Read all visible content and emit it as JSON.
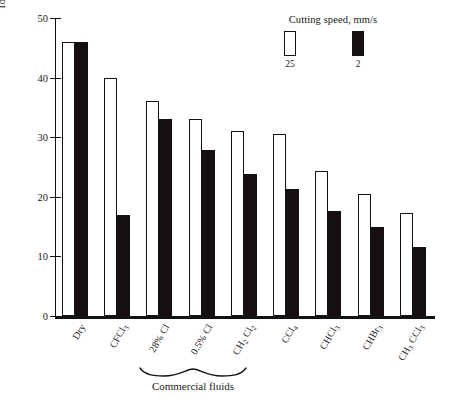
{
  "chart_data": {
    "type": "bar",
    "title": "",
    "xlabel": "",
    "ylabel": "Tool-chip friction angle β, deg",
    "ylim": [
      0,
      50
    ],
    "yticks": [
      0,
      10,
      20,
      30,
      40,
      50
    ],
    "grid": false,
    "legend": {
      "title": "Cutting speed, mm/s",
      "position": "top-right",
      "entries": [
        {
          "label": "25",
          "style": "open",
          "color": "#ffffff"
        },
        {
          "label": "2",
          "style": "filled",
          "color": "#150f10"
        }
      ]
    },
    "categories": [
      "Dry",
      "CFCl3",
      "28% Cl",
      "0.5% Cl",
      "CH2 Cl2",
      "CCl4",
      "CHCl3",
      "CHBr3",
      "CH3 CCl3"
    ],
    "series": [
      {
        "name": "25",
        "values": [
          46.0,
          40.0,
          36.0,
          33.0,
          31.0,
          30.5,
          24.3,
          20.5,
          17.3
        ]
      },
      {
        "name": "2",
        "values": [
          46.0,
          17.0,
          33.0,
          27.8,
          23.8,
          21.3,
          17.6,
          15.0,
          11.5
        ]
      }
    ],
    "annotations": [
      {
        "text": "Commercial fluids",
        "kind": "brace-label",
        "covers": [
          "28% Cl",
          "0.5% Cl"
        ]
      }
    ]
  },
  "axis": {
    "y_title": "Tool-chip friction angle β, deg",
    "y_tick_labels": [
      "50",
      "40",
      "30",
      "20",
      "10",
      "0"
    ]
  },
  "x_labels": [
    {
      "html": "Dry"
    },
    {
      "html": "CFCl<sub>3</sub>"
    },
    {
      "html": "28% Cl"
    },
    {
      "html": "0.5% Cl"
    },
    {
      "html": "CH<sub>2</sub> Cl<sub>2</sub>"
    },
    {
      "html": "CCl<sub>4</sub>"
    },
    {
      "html": "CHCl<sub>3</sub>"
    },
    {
      "html": "CHBr<sub>3</sub>"
    },
    {
      "html": "CH<sub>3</sub> CCl<sub>3</sub>"
    }
  ],
  "legend": {
    "title": "Cutting speed, mm/s",
    "key_open": "25",
    "key_filled": "2"
  },
  "brace": {
    "label": "Commercial fluids"
  },
  "colors": {
    "ink": "#111111",
    "fill": "#150f10",
    "open": "#ffffff",
    "background": "#ffffff"
  }
}
